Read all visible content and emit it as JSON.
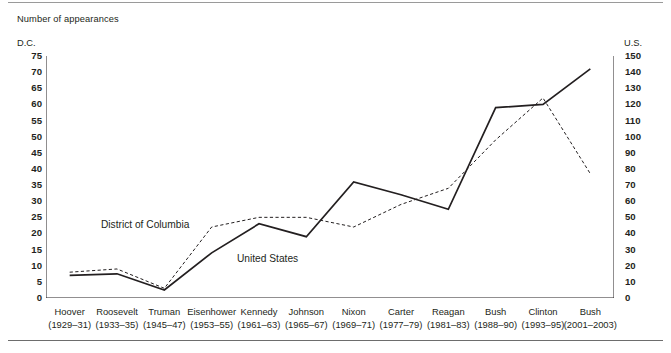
{
  "figure": {
    "title": "Number of appearances",
    "left_axis_unit": "D.C.",
    "right_axis_unit": "U.S."
  },
  "chart_data": {
    "type": "line",
    "title": "Number of appearances",
    "xlabel": "",
    "ylabel": "D.C.",
    "y2label": "U.S.",
    "ylim": [
      0,
      75
    ],
    "y2lim": [
      0,
      150
    ],
    "yticks": [
      0,
      5,
      10,
      15,
      20,
      25,
      30,
      35,
      40,
      45,
      50,
      55,
      60,
      65,
      70,
      75
    ],
    "y2ticks": [
      0,
      10,
      20,
      30,
      40,
      50,
      60,
      70,
      80,
      90,
      100,
      110,
      120,
      130,
      140,
      150
    ],
    "grid": false,
    "legend": "inline-labels",
    "categories": [
      "Hoover",
      "Roosevelt",
      "Truman",
      "Eisenhower",
      "Kennedy",
      "Johnson",
      "Nixon",
      "Carter",
      "Reagan",
      "Bush",
      "Clinton",
      "Bush"
    ],
    "category_years": [
      "(1929–31)",
      "(1933–35)",
      "(1945–47)",
      "(1953–55)",
      "(1961–63)",
      "(1965–67)",
      "(1969–71)",
      "(1977–79)",
      "(1981–83)",
      "(1988–90)",
      "(1993–95)",
      "(2001–2003)"
    ],
    "series": [
      {
        "name": "District of Columbia",
        "axis": "left",
        "style": "dashed",
        "color": "#231f20",
        "values": [
          8,
          9,
          3,
          22,
          25,
          25,
          22,
          29,
          34,
          49,
          62,
          38.5
        ]
      },
      {
        "name": "United States",
        "axis": "right",
        "style": "solid",
        "color": "#231f20",
        "values_left_scale": [
          7,
          7.5,
          2.5,
          14,
          23,
          19,
          36,
          32,
          27.5,
          59,
          60,
          71
        ],
        "values": [
          14,
          15,
          5,
          28,
          46,
          38,
          72,
          64,
          55,
          118,
          120,
          142
        ]
      }
    ]
  },
  "series_labels": {
    "dc": "District of Columbia",
    "us": "United States"
  }
}
